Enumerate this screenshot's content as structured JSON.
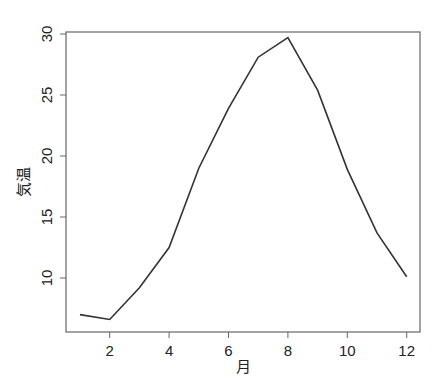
{
  "chart_data": {
    "type": "line",
    "title": "",
    "xlabel": "月",
    "ylabel": "気温",
    "x": [
      1,
      2,
      3,
      4,
      5,
      6,
      7,
      8,
      9,
      10,
      11,
      12
    ],
    "values": [
      7.0,
      6.6,
      9.2,
      12.5,
      19.0,
      23.9,
      28.1,
      29.7,
      25.4,
      18.9,
      13.7,
      10.1
    ],
    "xticks": [
      2,
      4,
      6,
      8,
      10,
      12
    ],
    "yticks": [
      10,
      15,
      20,
      25,
      30
    ],
    "xlim": [
      0.55,
      12.45
    ],
    "ylim": [
      6.3,
      30.0
    ],
    "grid": false,
    "legend": null,
    "line_color": "#333333",
    "frame_color": "#666666"
  },
  "labels": {
    "x_axis": "月",
    "y_axis": "気温"
  }
}
